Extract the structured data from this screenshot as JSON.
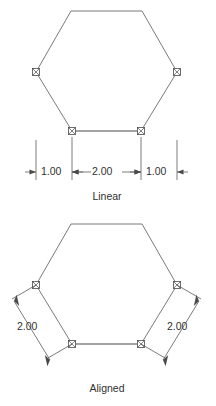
{
  "figure": {
    "title_upper": "Linear",
    "title_lower": "Aligned",
    "background_color": "#ffffff",
    "line_color": "#6b6b6b",
    "dimension_color": "#5a5a5a",
    "text_color": "#303030"
  },
  "upper": {
    "caption": "Linear",
    "caption_x": 107,
    "caption_y": 197,
    "hexagon": {
      "points": "71,11 142,11 177,72 141,131 72,131 36,72",
      "vertices": [
        {
          "x": 71,
          "y": 11,
          "grip": false
        },
        {
          "x": 142,
          "y": 11,
          "grip": false
        },
        {
          "x": 177,
          "y": 72,
          "grip": true
        },
        {
          "x": 141,
          "y": 131,
          "grip": true
        },
        {
          "x": 72,
          "y": 131,
          "grip": true
        },
        {
          "x": 36,
          "y": 72,
          "grip": true
        }
      ]
    },
    "dimensions": [
      {
        "label": "1.00",
        "x_start": 36,
        "x_end": 72,
        "text_x": 54,
        "arrows": "outside"
      },
      {
        "label": "2.00",
        "x_start": 72,
        "x_end": 141,
        "text_x": 106,
        "arrows": "inside"
      },
      {
        "label": "1.00",
        "x_start": 141,
        "x_end": 177,
        "text_x": 159,
        "arrows": "outside"
      }
    ],
    "dimension_line_y": 172,
    "ext_line_top_y": 140,
    "ext_line_bottom_y": 180
  },
  "lower": {
    "caption": "Aligned",
    "caption_x": 107,
    "caption_y": 389,
    "hexagon": {
      "points": "71,224 142,224 177,285 141,344 72,344 36,285",
      "vertices": [
        {
          "x": 71,
          "y": 224,
          "grip": false
        },
        {
          "x": 142,
          "y": 224,
          "grip": false
        },
        {
          "x": 177,
          "y": 285,
          "grip": true
        },
        {
          "x": 141,
          "y": 344,
          "grip": true
        },
        {
          "x": 72,
          "y": 344,
          "grip": true
        },
        {
          "x": 36,
          "y": 285,
          "grip": true
        }
      ]
    },
    "dimensions": [
      {
        "label": "2.00",
        "side": "left",
        "from_x": 36,
        "from_y": 285,
        "to_x": 72,
        "to_y": 344,
        "text_x": 33,
        "text_y": 325
      },
      {
        "label": "2.00",
        "side": "right",
        "from_x": 177,
        "from_y": 285,
        "to_x": 141,
        "to_y": 344,
        "text_x": 181,
        "text_y": 325
      }
    ]
  }
}
